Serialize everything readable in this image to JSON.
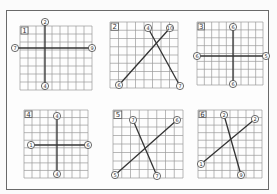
{
  "figure": {
    "colors": {
      "frame": "#6a6a6a",
      "grid": "#9a9a9a",
      "line": "#333333",
      "background": "#fdfdfd"
    },
    "panels": [
      {
        "id": "1",
        "label": "1",
        "grid": {
          "x": 20,
          "y": 26,
          "w": 72,
          "h": 64,
          "cols": 9,
          "rows": 8
        },
        "segments": [
          {
            "x1": 45,
            "y1": 22,
            "x2": 45,
            "y2": 86,
            "start": "②",
            "end": "④"
          },
          {
            "x1": 15,
            "y1": 48,
            "x2": 92,
            "y2": 48,
            "start": "⑦",
            "end": "⑨"
          }
        ]
      },
      {
        "id": "2",
        "label": "2",
        "grid": {
          "x": 110,
          "y": 22,
          "w": 68,
          "h": 66,
          "cols": 8,
          "rows": 8
        },
        "segments": [
          {
            "x1": 119,
            "y1": 85,
            "x2": 170,
            "y2": 28,
            "start": "⑥",
            "end": "⑩"
          },
          {
            "x1": 148,
            "y1": 28,
            "x2": 180,
            "y2": 86,
            "start": "④",
            "end": "⑦"
          }
        ]
      },
      {
        "id": "3",
        "label": "3",
        "grid": {
          "x": 197,
          "y": 22,
          "w": 66,
          "h": 63,
          "cols": 9,
          "rows": 8
        },
        "segments": [
          {
            "x1": 233,
            "y1": 27,
            "x2": 233,
            "y2": 84,
            "start": "⑥",
            "end": "⑥"
          },
          {
            "x1": 197,
            "y1": 56,
            "x2": 266,
            "y2": 56,
            "start": "⑥",
            "end": "⑤"
          }
        ]
      },
      {
        "id": "4",
        "label": "4",
        "grid": {
          "x": 24,
          "y": 110,
          "w": 64,
          "h": 68,
          "cols": 8,
          "rows": 9
        },
        "segments": [
          {
            "x1": 57,
            "y1": 116,
            "x2": 57,
            "y2": 174,
            "start": "④",
            "end": "④"
          },
          {
            "x1": 31,
            "y1": 145,
            "x2": 88,
            "y2": 145,
            "start": "①",
            "end": "⑥"
          }
        ]
      },
      {
        "id": "5",
        "label": "5",
        "grid": {
          "x": 113,
          "y": 110,
          "w": 70,
          "h": 68,
          "cols": 8,
          "rows": 8
        },
        "segments": [
          {
            "x1": 115,
            "y1": 175,
            "x2": 177,
            "y2": 120,
            "start": "⑤",
            "end": "⑥"
          },
          {
            "x1": 133,
            "y1": 120,
            "x2": 157,
            "y2": 176,
            "start": "⑦",
            "end": "⑦"
          }
        ]
      },
      {
        "id": "6",
        "label": "6",
        "grid": {
          "x": 198,
          "y": 110,
          "w": 64,
          "h": 68,
          "cols": 8,
          "rows": 9
        },
        "segments": [
          {
            "x1": 201,
            "y1": 164,
            "x2": 255,
            "y2": 119,
            "start": "①",
            "end": "②"
          },
          {
            "x1": 224,
            "y1": 115,
            "x2": 241,
            "y2": 175,
            "start": "②",
            "end": "⑨"
          }
        ]
      }
    ]
  }
}
